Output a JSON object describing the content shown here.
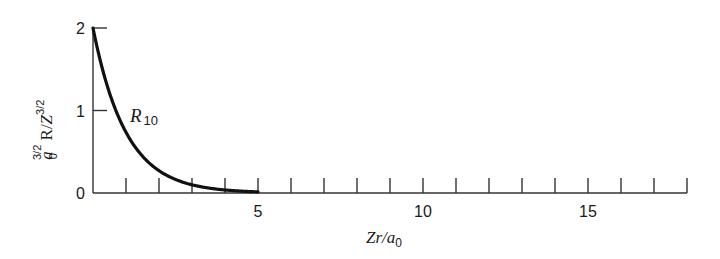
{
  "chart_data": {
    "type": "line",
    "title": "",
    "xlabel": "Zr/a0",
    "ylabel": "a0^(3/2) R/Z^(3/2)",
    "xlim": [
      0,
      18
    ],
    "ylim": [
      0,
      2
    ],
    "x_ticks": [
      1,
      2,
      3,
      4,
      5,
      6,
      7,
      8,
      9,
      10,
      11,
      12,
      13,
      14,
      15,
      16,
      17,
      18
    ],
    "x_tick_labels": [
      {
        "value": 5,
        "label": "5"
      },
      {
        "value": 10,
        "label": "10"
      },
      {
        "value": 15,
        "label": "15"
      }
    ],
    "y_ticks": [
      0,
      1,
      2
    ],
    "y_tick_labels": [
      {
        "value": 0,
        "label": "0"
      },
      {
        "value": 1,
        "label": "1"
      },
      {
        "value": 2,
        "label": "2"
      }
    ],
    "grid": false,
    "legend": null,
    "series": [
      {
        "name": "R10",
        "formula": "2*exp(-x)",
        "x": [
          0,
          0.25,
          0.5,
          0.75,
          1,
          1.5,
          2,
          2.5,
          3,
          3.5,
          4,
          4.5,
          5
        ],
        "values": [
          2.0,
          1.56,
          1.21,
          0.94,
          0.74,
          0.45,
          0.27,
          0.16,
          0.1,
          0.06,
          0.04,
          0.02,
          0.01
        ]
      }
    ],
    "annotations": [
      {
        "text": "R",
        "subscript": "10",
        "x": 1.2,
        "y": 0.9
      }
    ]
  },
  "labels": {
    "y_axis_a": "a",
    "y_axis_a_sub": "0",
    "y_axis_a_sup": "3/2",
    "y_axis_R": " R/",
    "y_axis_Z": "Z",
    "y_axis_Z_sup": "3/2",
    "x_axis_main": "Zr/a",
    "x_axis_sub": "0",
    "curve_name": "R",
    "curve_sub": "10"
  },
  "colors": {
    "axis": "#333333",
    "curve": "#111111",
    "background": "#ffffff"
  }
}
